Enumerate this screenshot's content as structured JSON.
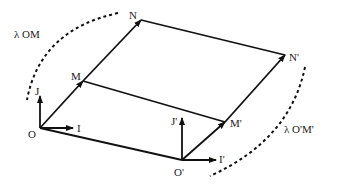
{
  "diagram": {
    "colors": {
      "stroke": "#111111",
      "text": "#222222",
      "background": "#ffffff"
    },
    "points": {
      "O": {
        "label": "O",
        "x": 40,
        "y": 128
      },
      "M": {
        "label": "M",
        "x": 83,
        "y": 81
      },
      "N": {
        "label": "N",
        "x": 141,
        "y": 20
      },
      "O2": {
        "label": "O'",
        "x": 182,
        "y": 160
      },
      "M2": {
        "label": "M'",
        "x": 225,
        "y": 122
      },
      "N2": {
        "label": "N'",
        "x": 285,
        "y": 55
      }
    },
    "vectors": {
      "I": {
        "label": "I"
      },
      "J": {
        "label": "J"
      },
      "I2": {
        "label": "I'"
      },
      "J2": {
        "label": "J'"
      }
    },
    "annotations": {
      "left_arc": "λ OM",
      "right_arc": "λ O'M'"
    }
  }
}
